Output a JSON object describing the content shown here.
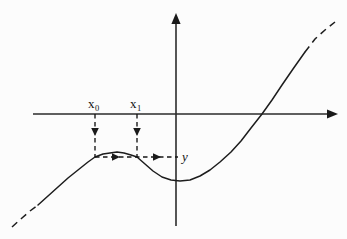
{
  "figure": {
    "background_color": "#fcfcfc",
    "ink_color": "#1d1d1d",
    "width": 347,
    "height": 239
  },
  "labels": {
    "x0": {
      "base": "x",
      "sub": "0"
    },
    "x1": {
      "base": "x",
      "sub": "1"
    },
    "y": "y"
  },
  "axes": {
    "x_axis": {
      "name": "x-axis",
      "y": 114,
      "x_start": 33,
      "x_end": 338,
      "arrow": "right"
    },
    "y_axis": {
      "name": "y-axis",
      "x": 176,
      "y_start": 226,
      "y_end": 13,
      "arrow": "up"
    }
  },
  "chart_data": {
    "type": "line",
    "xlabel": "",
    "ylabel": "",
    "grid": false,
    "legend": null,
    "series": [
      {
        "name": "cubic-curve-solid",
        "style": "solid",
        "points": [
          [
            38,
            205
          ],
          [
            48,
            196
          ],
          [
            58,
            187
          ],
          [
            68,
            178
          ],
          [
            78,
            170
          ],
          [
            88,
            162
          ],
          [
            95,
            157
          ],
          [
            103,
            154
          ],
          [
            110,
            153
          ],
          [
            117,
            152
          ],
          [
            124,
            153
          ],
          [
            131,
            155
          ],
          [
            137,
            157
          ],
          [
            145,
            164
          ],
          [
            153,
            171
          ],
          [
            162,
            177
          ],
          [
            171,
            180
          ],
          [
            180,
            181
          ],
          [
            190,
            180
          ],
          [
            200,
            176
          ],
          [
            210,
            170
          ],
          [
            220,
            162
          ],
          [
            231,
            152
          ],
          [
            241,
            141
          ],
          [
            251,
            128
          ],
          [
            262,
            114
          ],
          [
            272,
            100
          ],
          [
            282,
            85
          ],
          [
            293,
            69
          ],
          [
            305,
            52
          ]
        ]
      },
      {
        "name": "cubic-curve-dashed-lower-left",
        "style": "dashed",
        "points": [
          [
            12,
            227
          ],
          [
            22,
            218
          ],
          [
            30,
            211
          ],
          [
            38,
            205
          ]
        ]
      },
      {
        "name": "cubic-curve-dashed-upper-right",
        "style": "dashed",
        "points": [
          [
            305,
            52
          ],
          [
            315,
            39
          ],
          [
            325,
            30
          ],
          [
            335,
            22
          ]
        ]
      }
    ],
    "annotations": [
      {
        "name": "drop-line-x0",
        "kind": "vertical-dashed-arrow",
        "x": 95,
        "y_from": 114,
        "y_to": 157,
        "arrow_at": 134,
        "direction": "down"
      },
      {
        "name": "drop-line-x1",
        "kind": "vertical-dashed-arrow",
        "x": 137,
        "y_from": 114,
        "y_to": 157,
        "arrow_at": 134,
        "direction": "down"
      },
      {
        "name": "horizontal-trace-line",
        "kind": "horizontal-dashed-arrow",
        "y": 157,
        "x_from": 95,
        "x_to": 178,
        "arrows_at": [
          116,
          157
        ],
        "direction": "right"
      }
    ],
    "points_of_interest": [
      {
        "name": "x0-on-axis",
        "x": 95,
        "y": 114,
        "label": "x0"
      },
      {
        "name": "x1-on-axis",
        "x": 137,
        "y": 114,
        "label": "x1"
      },
      {
        "name": "local-maximum",
        "x": 117,
        "y": 152
      },
      {
        "name": "local-minimum",
        "x": 180,
        "y": 181
      },
      {
        "name": "root-crossing",
        "x": 262,
        "y": 114
      }
    ]
  }
}
